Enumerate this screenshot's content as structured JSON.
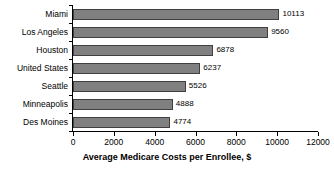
{
  "chart_data": {
    "type": "bar",
    "orientation": "horizontal",
    "title": "",
    "xlabel": "Average Medicare Costs per Enrollee, $",
    "ylabel": "",
    "categories": [
      "Miami",
      "Los Angeles",
      "Houston",
      "United States",
      "Seattle",
      "Minneapolis",
      "Des Moines"
    ],
    "values": [
      10113,
      9560,
      6878,
      6237,
      5526,
      4888,
      4774
    ],
    "value_labels": [
      "10113",
      "9560",
      "6878",
      "6237",
      "5526",
      "4888",
      "4774"
    ],
    "xlim": [
      0,
      12000
    ],
    "xticks": [
      0,
      2000,
      4000,
      6000,
      8000,
      10000,
      12000
    ],
    "xtick_labels": [
      "0",
      "2000",
      "4000",
      "6000",
      "8000",
      "10000",
      "12000"
    ],
    "grid": false,
    "legend": false,
    "bar_color": "#808080",
    "bar_edge_color": "#404040",
    "axis_color": "#000000",
    "background_color": "#ffffff"
  }
}
